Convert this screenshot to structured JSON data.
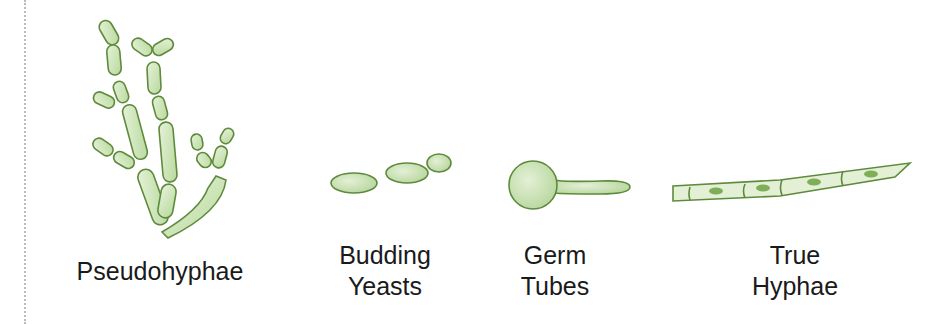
{
  "figure": {
    "colors": {
      "cell_fill": "#c9e4b4",
      "cell_fill_light": "#e3f1d6",
      "cell_stroke": "#5e8a3c",
      "nucleus": "#7fae58",
      "label_text": "#1a1a1a",
      "border_dots": "#b9b9b9"
    },
    "panels": [
      {
        "id": "pseudohyphae",
        "label_lines": [
          "Pseudohyphae"
        ],
        "icon": "pseudohyphae-icon"
      },
      {
        "id": "budding-yeasts",
        "label_lines": [
          "Budding",
          "Yeasts"
        ],
        "icon": "budding-yeast-icon"
      },
      {
        "id": "germ-tubes",
        "label_lines": [
          "Germ",
          "Tubes"
        ],
        "icon": "germ-tube-icon"
      },
      {
        "id": "true-hyphae",
        "label_lines": [
          "True",
          "Hyphae"
        ],
        "icon": "true-hyphae-icon"
      }
    ]
  }
}
